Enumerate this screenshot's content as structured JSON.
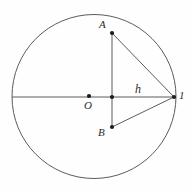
{
  "figure": {
    "background_color": "#fefefe",
    "stroke_color": "#4a4a4a",
    "label_color": "#2b2b2b",
    "labels": {
      "point_a": "A",
      "point_b": "B",
      "center_o": "O",
      "segment_h": "h",
      "vertex_right": "1"
    },
    "geometry": {
      "circle": {
        "cx": 94,
        "cy": 96.5,
        "r": 82
      },
      "diameter_line": {
        "x1": 12,
        "y1": 97,
        "x2": 176,
        "y2": 97
      },
      "chord_ab": {
        "x1": 112,
        "y1": 33,
        "x2": 112,
        "y2": 127
      },
      "line_a_to_vertex": {
        "x1": 112,
        "y1": 33,
        "x2": 174,
        "y2": 97
      },
      "line_b_to_vertex": {
        "x1": 112,
        "y1": 127,
        "x2": 174,
        "y2": 97
      },
      "points": [
        {
          "name": "A",
          "x": 112,
          "y": 33
        },
        {
          "name": "B",
          "x": 112,
          "y": 127
        },
        {
          "name": "O",
          "x": 89,
          "y": 96
        },
        {
          "name": "chord-midpoint",
          "x": 112,
          "y": 97
        },
        {
          "name": "vertex",
          "x": 174,
          "y": 97
        }
      ]
    }
  }
}
